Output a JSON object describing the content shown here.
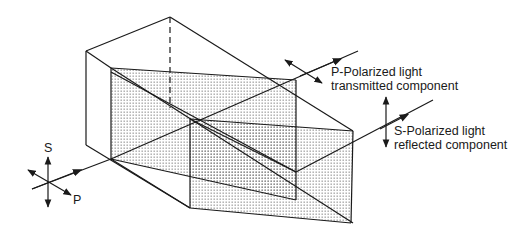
{
  "diagram": {
    "type": "polarizing beamsplitter cube",
    "labels": {
      "transmitted_line1": "P-Polarized light",
      "transmitted_line2": "transmitted component",
      "reflected_line1": "S-Polarized light",
      "reflected_line2": "reflected component",
      "input_s": "S",
      "input_p": "P"
    },
    "colors": {
      "stroke": "#1a1a1a",
      "hatch_dot": "#555555",
      "background": "#ffffff"
    }
  }
}
